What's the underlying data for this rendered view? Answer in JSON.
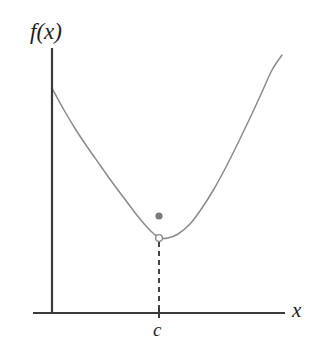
{
  "figure": {
    "background_color": "#ffffff"
  },
  "labels": {
    "y_axis": "f(x)",
    "x_axis": "x",
    "x_tick": "c"
  },
  "colors": {
    "axis": "#3a3a3a",
    "curve": "#8a8a8a",
    "dashed_line": "#444444",
    "filled_point": "#7a7a7a",
    "open_point_stroke": "#8a8a8a",
    "open_point_fill": "#ffffff",
    "text": "#1d1d1d"
  },
  "chart_data": {
    "type": "line",
    "xlabel": "x",
    "ylabel": "f(x)",
    "grid": false,
    "legend": null,
    "curve": {
      "name": "f(x)",
      "shape": "parabola",
      "points": [
        [
          52,
          88
        ],
        [
          64,
          110
        ],
        [
          76,
          130
        ],
        [
          88,
          148
        ],
        [
          100,
          165
        ],
        [
          112,
          182
        ],
        [
          124,
          198
        ],
        [
          136,
          214
        ],
        [
          146,
          226
        ],
        [
          154,
          234
        ],
        [
          160,
          238
        ],
        [
          168,
          238
        ],
        [
          178,
          234
        ],
        [
          190,
          224
        ],
        [
          202,
          208
        ],
        [
          214,
          189
        ],
        [
          226,
          167
        ],
        [
          238,
          143
        ],
        [
          250,
          118
        ],
        [
          262,
          92
        ],
        [
          272,
          70
        ],
        [
          282,
          55
        ]
      ]
    },
    "axes": {
      "x_axis": {
        "x1": 33,
        "y1": 313,
        "x2": 285,
        "y2": 313
      },
      "y_axis": {
        "x1": 52,
        "y1": 48,
        "x2": 52,
        "y2": 313
      }
    },
    "annotations": [
      {
        "name": "filled-point",
        "kind": "filled_circle",
        "x": 159,
        "y": 216,
        "radius": 3.6,
        "meaning": "value of f at c"
      },
      {
        "name": "open-point",
        "kind": "open_circle",
        "x": 159,
        "y": 238,
        "radius": 3.4,
        "meaning": "limit of f as x approaches c (not attained)"
      },
      {
        "name": "dashed-drop-line",
        "kind": "dashed_segment",
        "x": 159,
        "y_top": 242,
        "y_bottom": 313
      },
      {
        "name": "x-tick-c",
        "kind": "tick",
        "x": 159,
        "y": 313,
        "label": "c"
      }
    ]
  }
}
